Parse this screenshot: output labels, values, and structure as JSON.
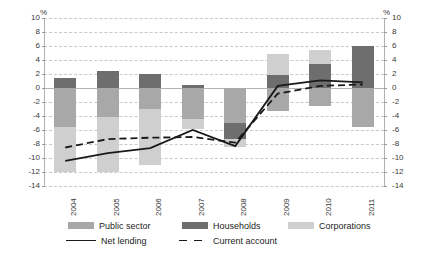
{
  "axis": {
    "unit_label_left": "%",
    "unit_label_right": "%",
    "yticks": [
      "10",
      "8",
      "6",
      "4",
      "2",
      "0",
      "-2",
      "-4",
      "-6",
      "-8",
      "-10",
      "-12",
      "-14"
    ],
    "yticks_right": [
      "10",
      "8",
      "6",
      "4",
      "2",
      "0",
      "-2",
      "-4",
      "-6",
      "-8",
      "-10",
      "-12",
      "-14"
    ]
  },
  "legend": {
    "public_sector": "Public sector",
    "households": "Households",
    "corporations": "Corporations",
    "net_lending": "Net lending",
    "current_account": "Current account"
  },
  "colors": {
    "public_sector": "#a8a8a8",
    "households": "#6e6e6e",
    "corporations": "#cfcfcf",
    "net_lending": "#1a1a1a",
    "current_account": "#1a1a1a",
    "grid": "#c9c9c9",
    "zero_line": "#b4b4b4"
  },
  "chart_data": {
    "type": "bar",
    "title": "",
    "xlabel": "",
    "ylabel": "%",
    "ylim": [
      -14,
      10
    ],
    "ytick_step": 2,
    "grid": true,
    "legend_position": "bottom",
    "categories": [
      "2004",
      "2005",
      "2006",
      "2007",
      "2008",
      "2009",
      "2010",
      "2011"
    ],
    "stacked": true,
    "series": [
      {
        "name": "Public sector",
        "values": [
          -5.5,
          -4.2,
          -3.0,
          -4.4,
          -5.0,
          -3.3,
          -2.6,
          -5.5
        ]
      },
      {
        "name": "Households",
        "values": [
          1.5,
          2.5,
          2.0,
          0.4,
          -2.3,
          1.8,
          3.4,
          6.0
        ]
      },
      {
        "name": "Corporations",
        "values": [
          -6.5,
          -7.8,
          -8.0,
          -1.5,
          -1.2,
          3.1,
          2.1,
          0.0
        ]
      }
    ],
    "lines": [
      {
        "name": "Net lending",
        "style": "solid",
        "values": [
          -10.4,
          -9.3,
          -8.6,
          -6.0,
          -8.3,
          0.3,
          1.1,
          0.8
        ]
      },
      {
        "name": "Current account",
        "style": "dashed",
        "values": [
          -8.5,
          -7.3,
          -7.1,
          -7.0,
          -7.8,
          -0.8,
          0.3,
          0.5
        ]
      }
    ]
  }
}
